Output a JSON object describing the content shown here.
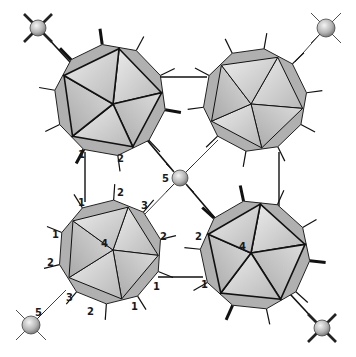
{
  "figure": {
    "colors": {
      "background": "#ffffff",
      "edge": "#111111",
      "face_light": "#e4e4e4",
      "face_mid": "#c9c9c9",
      "face_dark": "#9d9d9d",
      "sphere_light": "#eeeeee",
      "sphere_dark": "#777777"
    }
  },
  "clusters": [
    {
      "id": "top-left",
      "cx": 110,
      "cy": 100,
      "r": 56,
      "rot": -8,
      "center_label": ""
    },
    {
      "id": "top-right",
      "cx": 255,
      "cy": 100,
      "r": 52,
      "rot": 10,
      "center_label": ""
    },
    {
      "id": "bottom-left",
      "cx": 110,
      "cy": 252,
      "r": 52,
      "rot": 4,
      "center_label": "4"
    },
    {
      "id": "bottom-right",
      "cx": 255,
      "cy": 255,
      "r": 55,
      "rot": -12,
      "center_label": "4"
    }
  ],
  "spheres": [
    {
      "id": "center",
      "cx": 180,
      "cy": 178,
      "r": 8,
      "label": "5",
      "lx": 162,
      "ly": 182,
      "crossed": false
    },
    {
      "id": "top-left-cap",
      "cx": 38,
      "cy": 28,
      "r": 8,
      "label": "",
      "crossed": true
    },
    {
      "id": "top-right-cap",
      "cx": 326,
      "cy": 28,
      "r": 9,
      "label": "",
      "crossed": false
    },
    {
      "id": "bottom-left-cap",
      "cx": 31,
      "cy": 325,
      "r": 9,
      "label": "5",
      "lx": 35,
      "ly": 316,
      "crossed": false
    },
    {
      "id": "bottom-right-cap",
      "cx": 322,
      "cy": 328,
      "r": 8,
      "label": "",
      "crossed": true
    }
  ],
  "vertex_labels": [
    {
      "text": "1",
      "x": 78,
      "y": 158
    },
    {
      "text": "2",
      "x": 117,
      "y": 162
    },
    {
      "text": "1",
      "x": 78,
      "y": 206
    },
    {
      "text": "2",
      "x": 117,
      "y": 196
    },
    {
      "text": "3",
      "x": 141,
      "y": 209
    },
    {
      "text": "1",
      "x": 52,
      "y": 238
    },
    {
      "text": "2",
      "x": 160,
      "y": 240
    },
    {
      "text": "2",
      "x": 47,
      "y": 266
    },
    {
      "text": "1",
      "x": 153,
      "y": 290
    },
    {
      "text": "3",
      "x": 66,
      "y": 301
    },
    {
      "text": "2",
      "x": 87,
      "y": 315
    },
    {
      "text": "1",
      "x": 131,
      "y": 310
    },
    {
      "text": "2",
      "x": 195,
      "y": 240
    },
    {
      "text": "1",
      "x": 201,
      "y": 288
    }
  ]
}
